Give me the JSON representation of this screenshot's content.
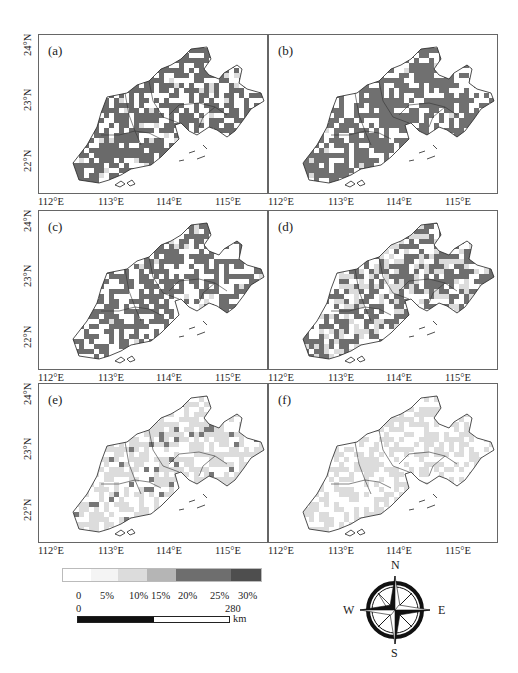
{
  "chart_data": {
    "type": "heatmap",
    "title": "",
    "panels": [
      {
        "id": "a",
        "label": "(a)",
        "dominant_class": "20%-25%",
        "coverage": "high"
      },
      {
        "id": "b",
        "label": "(b)",
        "dominant_class": "20%-25%",
        "coverage": "high"
      },
      {
        "id": "c",
        "label": "(c)",
        "dominant_class": "20%-25%",
        "coverage": "high"
      },
      {
        "id": "d",
        "label": "(d)",
        "dominant_class": "20%-25% mixed with 10%-15%",
        "coverage": "medium"
      },
      {
        "id": "e",
        "label": "(e)",
        "dominant_class": "10%-15% with scattered 20%-25%",
        "coverage": "low"
      },
      {
        "id": "f",
        "label": "(f)",
        "dominant_class": "10%-15%",
        "coverage": "low"
      }
    ],
    "x_ticks": [
      "112°E",
      "113°E",
      "114°E",
      "115°E"
    ],
    "y_ticks": [
      "24°N",
      "23°N",
      "22°N"
    ],
    "xlim": [
      112,
      115.7
    ],
    "ylim": [
      21.4,
      24
    ],
    "legend": {
      "labels": [
        "0",
        "5%",
        "10%",
        "15%",
        "20%",
        "25%",
        "30%"
      ],
      "colors": [
        "#ffffff",
        "#f4f4f4",
        "#dcdcdc",
        "#b5b5b5",
        "#6e6e6e",
        "#6a6a6a",
        "#4e4e4e"
      ]
    },
    "grid": false
  },
  "panels": {
    "a": {
      "label": "(a)"
    },
    "b": {
      "label": "(b)"
    },
    "c": {
      "label": "(c)"
    },
    "d": {
      "label": "(d)"
    },
    "e": {
      "label": "(e)"
    },
    "f": {
      "label": "(f)"
    }
  },
  "axes": {
    "x": [
      "112°E",
      "113°E",
      "114°E",
      "115°E"
    ],
    "y": [
      "24°N",
      "23°N",
      "22°N"
    ]
  },
  "legend": {
    "ticks": [
      "0",
      "5%",
      "10%",
      "15%",
      "20%",
      "25%",
      "30%"
    ]
  },
  "scale_bar": {
    "start": "0",
    "end": "280",
    "unit": "km"
  },
  "compass": {
    "n": "N",
    "s": "S",
    "e": "E",
    "w": "W"
  }
}
